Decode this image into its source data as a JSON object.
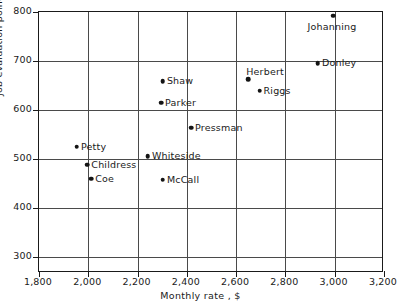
{
  "chart_data": {
    "type": "scatter",
    "title": "",
    "xlabel": "Monthly rate , $",
    "ylabel": "Job evaluation points",
    "xlim": [
      1800,
      3200
    ],
    "ylim": [
      267,
      800
    ],
    "xticks": [
      "1,800",
      "2,000",
      "2,200",
      "2,400",
      "2,600",
      "2,800",
      "3,000",
      "3,200"
    ],
    "xtick_values": [
      1800,
      2000,
      2200,
      2400,
      2600,
      2800,
      3000,
      3200
    ],
    "yticks": [
      "300",
      "400",
      "500",
      "600",
      "700",
      "800"
    ],
    "ytick_values": [
      300,
      400,
      500,
      600,
      700,
      800
    ],
    "grid": true,
    "legend": "none",
    "points": [
      {
        "label": "Petty",
        "x": 1958,
        "y": 523,
        "label_pos": "right"
      },
      {
        "label": "Childress",
        "x": 2000,
        "y": 486,
        "label_pos": "right"
      },
      {
        "label": "Coe",
        "x": 2016,
        "y": 458,
        "label_pos": "right"
      },
      {
        "label": "Whiteside",
        "x": 2246,
        "y": 503,
        "label_pos": "right"
      },
      {
        "label": "Shaw",
        "x": 2307,
        "y": 657,
        "label_pos": "right"
      },
      {
        "label": "McCall",
        "x": 2307,
        "y": 456,
        "label_pos": "right"
      },
      {
        "label": "Parker",
        "x": 2299,
        "y": 613,
        "label_pos": "right"
      },
      {
        "label": "Pressman",
        "x": 2421,
        "y": 562,
        "label_pos": "right"
      },
      {
        "label": "Herbert",
        "x": 2653,
        "y": 661,
        "label_pos": "above-right"
      },
      {
        "label": "Riggs",
        "x": 2699,
        "y": 637,
        "label_pos": "right"
      },
      {
        "label": "Donley",
        "x": 2936,
        "y": 693,
        "label_pos": "right"
      },
      {
        "label": "Johanning",
        "x": 2997,
        "y": 790,
        "label_pos": "below"
      }
    ]
  },
  "style": {
    "point_color": "#141414",
    "grid_color": "#4a4a4a",
    "axis_color": "#1a1a1a",
    "background": "#ffffff"
  }
}
